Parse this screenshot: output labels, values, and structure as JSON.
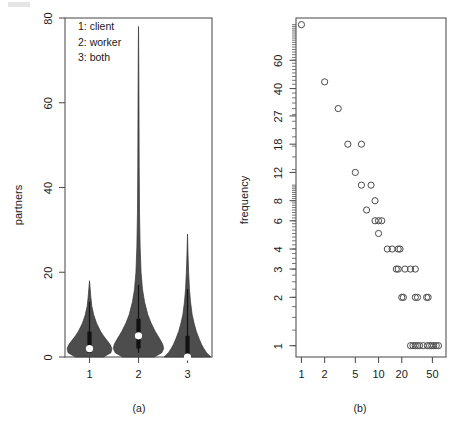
{
  "figure": {
    "panel_a_caption": "(a)",
    "panel_b_caption": "(b)"
  },
  "panel_a": {
    "ylabel": "partners",
    "legend": [
      "1: client",
      "2: worker",
      "3: both"
    ],
    "x_tick_labels": [
      "1",
      "2",
      "3"
    ],
    "y_tick_labels": [
      "0",
      "20",
      "40",
      "60",
      "80"
    ]
  },
  "panel_b": {
    "ylabel": "frequency",
    "x_tick_labels": [
      "1",
      "2",
      "5",
      "10",
      "20",
      "50"
    ],
    "y_tick_labels": [
      "1",
      "2",
      "3",
      "4",
      "6",
      "8",
      "12",
      "18",
      "27",
      "40",
      "60"
    ]
  },
  "chart_data": [
    {
      "type": "violin",
      "panel": "(a)",
      "title": "",
      "xlabel": "",
      "ylabel": "partners",
      "xlim": [
        0.5,
        3.5
      ],
      "ylim": [
        0,
        80
      ],
      "ytick_values": [
        0,
        20,
        40,
        60,
        80
      ],
      "xtick_values": [
        1,
        2,
        3
      ],
      "grid": false,
      "legend_position": "top-left",
      "legend_entries": [
        "1: client",
        "2: worker",
        "3: both"
      ],
      "groups": [
        {
          "name": "1",
          "label": "client",
          "median": 2,
          "q1": 1,
          "q3": 6,
          "whisker_low": 1,
          "whisker_high": 13,
          "data_min": 0,
          "data_max": 18,
          "density_profile": [
            {
              "y": 0,
              "w": 0.3
            },
            {
              "y": 1,
              "w": 0.46
            },
            {
              "y": 2,
              "w": 0.48
            },
            {
              "y": 3,
              "w": 0.44
            },
            {
              "y": 4,
              "w": 0.37
            },
            {
              "y": 5,
              "w": 0.3
            },
            {
              "y": 6,
              "w": 0.24
            },
            {
              "y": 8,
              "w": 0.15
            },
            {
              "y": 10,
              "w": 0.09
            },
            {
              "y": 12,
              "w": 0.05
            },
            {
              "y": 14,
              "w": 0.03
            },
            {
              "y": 16,
              "w": 0.015
            },
            {
              "y": 18,
              "w": 0.0
            }
          ]
        },
        {
          "name": "2",
          "label": "worker",
          "median": 5,
          "q1": 2,
          "q3": 9,
          "whisker_low": 1,
          "whisker_high": 17,
          "data_min": 0,
          "data_max": 78,
          "density_profile": [
            {
              "y": 0,
              "w": 0.34
            },
            {
              "y": 1,
              "w": 0.5
            },
            {
              "y": 2,
              "w": 0.54
            },
            {
              "y": 3,
              "w": 0.52
            },
            {
              "y": 4,
              "w": 0.47
            },
            {
              "y": 6,
              "w": 0.36
            },
            {
              "y": 8,
              "w": 0.27
            },
            {
              "y": 10,
              "w": 0.2
            },
            {
              "y": 13,
              "w": 0.13
            },
            {
              "y": 16,
              "w": 0.085
            },
            {
              "y": 20,
              "w": 0.055
            },
            {
              "y": 26,
              "w": 0.035
            },
            {
              "y": 34,
              "w": 0.022
            },
            {
              "y": 45,
              "w": 0.015
            },
            {
              "y": 60,
              "w": 0.01
            },
            {
              "y": 70,
              "w": 0.006
            },
            {
              "y": 78,
              "w": 0.0
            }
          ]
        },
        {
          "name": "3",
          "label": "both",
          "median": 0,
          "q1": 0,
          "q3": 5,
          "whisker_low": 0,
          "whisker_high": 16,
          "data_min": 0,
          "data_max": 29,
          "density_profile": [
            {
              "y": 0,
              "w": 0.5
            },
            {
              "y": 1,
              "w": 0.41
            },
            {
              "y": 2,
              "w": 0.35
            },
            {
              "y": 3,
              "w": 0.3
            },
            {
              "y": 4,
              "w": 0.26
            },
            {
              "y": 6,
              "w": 0.19
            },
            {
              "y": 8,
              "w": 0.14
            },
            {
              "y": 10,
              "w": 0.1
            },
            {
              "y": 13,
              "w": 0.065
            },
            {
              "y": 16,
              "w": 0.042
            },
            {
              "y": 20,
              "w": 0.024
            },
            {
              "y": 24,
              "w": 0.012
            },
            {
              "y": 29,
              "w": 0.0
            }
          ]
        }
      ]
    },
    {
      "type": "scatter",
      "panel": "(b)",
      "title": "",
      "xlabel": "",
      "ylabel": "frequency",
      "xscale": "log",
      "yscale": "log",
      "xlim": [
        0.85,
        75
      ],
      "ylim": [
        0.85,
        110
      ],
      "xtick_values": [
        1,
        2,
        5,
        10,
        20,
        50
      ],
      "ytick_values": [
        1,
        2,
        3,
        4,
        6,
        8,
        12,
        18,
        27,
        40,
        60
      ],
      "grid": false,
      "marker": "open-circle",
      "points": [
        {
          "x": 1,
          "y": 100
        },
        {
          "x": 2,
          "y": 44
        },
        {
          "x": 3,
          "y": 30
        },
        {
          "x": 4,
          "y": 18
        },
        {
          "x": 6,
          "y": 18
        },
        {
          "x": 5,
          "y": 12
        },
        {
          "x": 6,
          "y": 10
        },
        {
          "x": 8,
          "y": 10
        },
        {
          "x": 9,
          "y": 8
        },
        {
          "x": 7,
          "y": 7
        },
        {
          "x": 9,
          "y": 6
        },
        {
          "x": 10,
          "y": 6
        },
        {
          "x": 11,
          "y": 6
        },
        {
          "x": 10,
          "y": 5
        },
        {
          "x": 13,
          "y": 4
        },
        {
          "x": 15,
          "y": 4
        },
        {
          "x": 18,
          "y": 4
        },
        {
          "x": 19,
          "y": 4
        },
        {
          "x": 17,
          "y": 3
        },
        {
          "x": 18,
          "y": 3
        },
        {
          "x": 22,
          "y": 3
        },
        {
          "x": 26,
          "y": 3
        },
        {
          "x": 30,
          "y": 3
        },
        {
          "x": 20,
          "y": 2
        },
        {
          "x": 21,
          "y": 2
        },
        {
          "x": 30,
          "y": 2
        },
        {
          "x": 32,
          "y": 2
        },
        {
          "x": 42,
          "y": 2
        },
        {
          "x": 44,
          "y": 2
        },
        {
          "x": 26,
          "y": 1
        },
        {
          "x": 28,
          "y": 1
        },
        {
          "x": 30,
          "y": 1
        },
        {
          "x": 32,
          "y": 1
        },
        {
          "x": 34,
          "y": 1
        },
        {
          "x": 38,
          "y": 1
        },
        {
          "x": 43,
          "y": 1
        },
        {
          "x": 46,
          "y": 1
        },
        {
          "x": 49,
          "y": 1
        },
        {
          "x": 52,
          "y": 1
        },
        {
          "x": 56,
          "y": 1
        },
        {
          "x": 60,
          "y": 1
        }
      ]
    }
  ]
}
